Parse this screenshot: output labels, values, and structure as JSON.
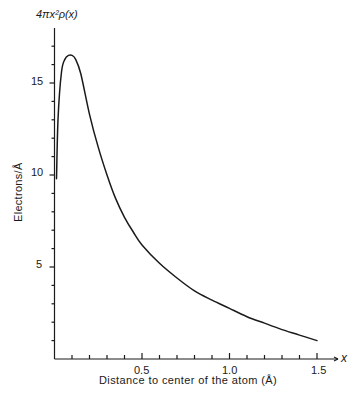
{
  "chart_data": {
    "type": "line",
    "title": "",
    "xlabel": "Distance to center of the atom (Å)",
    "ylabel": "Electrons/Å",
    "y_top_label": "4πx²ρ(x)",
    "x_axis_var": "x",
    "xlim": [
      0,
      1.55
    ],
    "ylim": [
      0,
      18
    ],
    "x_ticks": [
      0.5,
      1.0,
      1.5
    ],
    "x_tick_labels": [
      "0.5",
      "1.0",
      "1.5"
    ],
    "x_minor_step": 0.1,
    "y_ticks": [
      5,
      10,
      15
    ],
    "y_tick_labels": [
      "5",
      "10",
      "15"
    ],
    "y_minor_step": 1,
    "grid": false,
    "legend": null,
    "series": [
      {
        "name": "radial electron density",
        "x": [
          0.0,
          0.02,
          0.04,
          0.06,
          0.08,
          0.1,
          0.12,
          0.15,
          0.2,
          0.25,
          0.3,
          0.35,
          0.4,
          0.45,
          0.5,
          0.6,
          0.7,
          0.8,
          0.9,
          1.0,
          1.1,
          1.2,
          1.3,
          1.4,
          1.5
        ],
        "values": [
          9.8,
          13.0,
          15.6,
          16.3,
          16.5,
          16.5,
          16.3,
          15.5,
          13.3,
          11.5,
          10.0,
          8.7,
          7.7,
          6.9,
          6.2,
          5.2,
          4.4,
          3.7,
          3.2,
          2.75,
          2.3,
          1.95,
          1.6,
          1.3,
          1.0
        ]
      }
    ]
  },
  "labels": {
    "y_top": "4πx²ρ(x)",
    "y_title": "Electrons/Å",
    "x_title": "Distance to center of the atom (Å)",
    "x_var": "x",
    "y_ticks": [
      "5",
      "10",
      "15"
    ],
    "x_ticks": [
      "0.5",
      "1.0",
      "1.5"
    ]
  }
}
